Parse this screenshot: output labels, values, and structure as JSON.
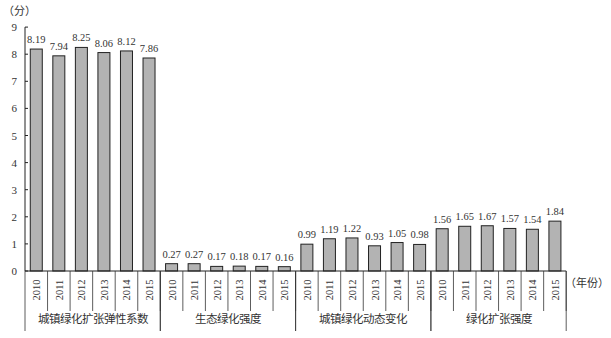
{
  "chart_data": {
    "type": "bar",
    "title": "",
    "ylabel": "（分）",
    "xlabel": "（年份）",
    "ylim": [
      0,
      9
    ],
    "yticks": [
      0,
      1,
      2,
      3,
      4,
      5,
      6,
      7,
      8,
      9
    ],
    "grid": false,
    "legend": null,
    "bar_color": "#b3b3b3",
    "bar_edge_color": "#222222",
    "groups": [
      {
        "name": "城镇绿化扩张弹性系数",
        "categories": [
          "2010",
          "2011",
          "2012",
          "2013",
          "2014",
          "2015"
        ],
        "values": [
          8.19,
          7.94,
          8.25,
          8.06,
          8.12,
          7.86
        ]
      },
      {
        "name": "生态绿化强度",
        "categories": [
          "2010",
          "2011",
          "2012",
          "2013",
          "2014",
          "2015"
        ],
        "values": [
          0.27,
          0.27,
          0.17,
          0.18,
          0.17,
          0.16
        ]
      },
      {
        "name": "城镇绿化动态变化",
        "categories": [
          "2010",
          "2011",
          "2012",
          "2013",
          "2014",
          "2015"
        ],
        "values": [
          0.99,
          1.19,
          1.22,
          0.93,
          1.05,
          0.98
        ]
      },
      {
        "name": "绿化扩张强度",
        "categories": [
          "2010",
          "2011",
          "2012",
          "2013",
          "2014",
          "2015"
        ],
        "values": [
          1.56,
          1.65,
          1.67,
          1.57,
          1.54,
          1.84
        ]
      }
    ]
  }
}
